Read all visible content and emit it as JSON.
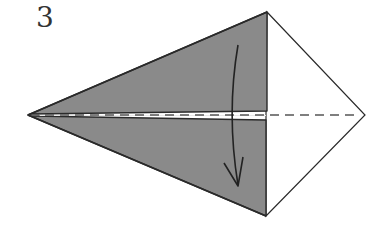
{
  "diagram": {
    "step_number": "3",
    "kind": "origami-fold-step",
    "colors": {
      "paper_color_side": "#8a8a8a",
      "paper_white_side": "#ffffff",
      "outline": "#2a2a2a",
      "valley_line": "#555555",
      "arrow": "#222222"
    },
    "shape": {
      "left_tip": [
        28,
        115
      ],
      "top_vertex": [
        267,
        12
      ],
      "bottom_vertex": [
        266,
        216
      ],
      "right_tip": [
        365,
        115
      ]
    },
    "fold_line": "valley-fold-dashed-horizontal",
    "arrow": "fold-down-arrow"
  }
}
